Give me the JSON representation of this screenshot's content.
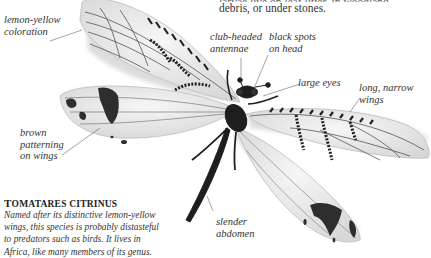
{
  "intro_text": {
    "cut_line": "larvae live on leaf litter, in woodland",
    "visible_line": "debris, or under stones."
  },
  "labels": {
    "lemon_yellow": [
      "lemon-yellow",
      "coloration"
    ],
    "club_headed": [
      "club-headed",
      "antennae"
    ],
    "black_spots": [
      "black spots",
      "on head"
    ],
    "large_eyes": [
      "large eyes"
    ],
    "long_narrow": [
      "long, narrow",
      "wings"
    ],
    "brown_patterning": [
      "brown",
      "patterning",
      "on wings"
    ],
    "slender_abdomen": [
      "slender",
      "abdomen"
    ]
  },
  "caption": {
    "title_first": "T",
    "title_rest": "OMATARES CITRINUS",
    "body": [
      "Named after its distinctive lemon-yellow",
      "wings, this species is probably distasteful",
      "to predators such as birds. It lives in",
      "Africa, like many members of  its genus."
    ]
  },
  "colors": {
    "wing_fill": "#ececec",
    "wing_edge": "#bdbdbd",
    "vein": "#555555",
    "pattern": "#2a2a2a",
    "body": "#1e1e1e",
    "leader_line": "#666666"
  }
}
